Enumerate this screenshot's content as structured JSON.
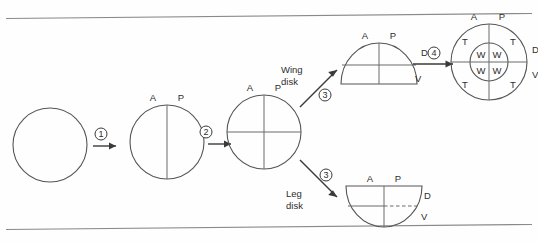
{
  "figure": {
    "background_color": "#fefefe",
    "line_color": "#4a4a4a",
    "rule_color": "#8a8a8a"
  },
  "axis_labels": {
    "anterior": "A",
    "posterior": "P",
    "dorsal": "D",
    "ventral": "V"
  },
  "region_labels": {
    "wing": "W",
    "thorax": "T"
  },
  "steps": [
    {
      "id": "step-1",
      "number": "1"
    },
    {
      "id": "step-2",
      "number": "2"
    },
    {
      "id": "step-3-wing",
      "number": "3"
    },
    {
      "id": "step-3-leg",
      "number": "3"
    },
    {
      "id": "step-4",
      "number": "4"
    }
  ],
  "stages": [
    {
      "id": "stage-naive-disk",
      "name": "undifferentiated-disk",
      "shape": "circle",
      "labels": []
    },
    {
      "id": "stage-ap-disk",
      "name": "anterior-posterior-disk",
      "shape": "circle-vertical-split",
      "labels": [
        "A",
        "P"
      ]
    },
    {
      "id": "stage-quadrant-disk",
      "name": "quadrant-disk",
      "shape": "circle-crosshair",
      "labels": [
        "A",
        "P"
      ]
    },
    {
      "id": "stage-wing-disk",
      "name": "wing-disk",
      "shape": "dome-up",
      "labels": [
        "A",
        "P",
        "D",
        "V"
      ]
    },
    {
      "id": "stage-leg-disk",
      "name": "leg-disk",
      "shape": "dome-down",
      "labels": [
        "A",
        "P",
        "D",
        "V"
      ]
    },
    {
      "id": "stage-wing-thorax-disk",
      "name": "wing-thorax-disk",
      "shape": "concentric-circles-crosshair",
      "labels": [
        "A",
        "P",
        "D",
        "V"
      ],
      "inner_regions": [
        "W",
        "W",
        "W",
        "W"
      ],
      "outer_regions": [
        "T",
        "T",
        "T",
        "T"
      ]
    }
  ],
  "branch_labels": {
    "wing_disk_line1": "Wing",
    "wing_disk_line2": "disk",
    "leg_disk_line1": "Leg",
    "leg_disk_line2": "disk"
  }
}
